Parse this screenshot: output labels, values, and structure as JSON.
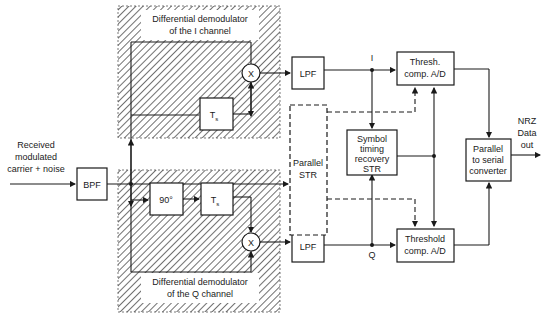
{
  "diagram": {
    "input_label_line1": "Received",
    "input_label_line2": "modulated",
    "input_label_line3": "carrier + noise",
    "bpf": "BPF",
    "i_channel": {
      "title_line1": "Differential demodulator",
      "title_line2": "of the I channel",
      "delay": "T",
      "delay_sub": "s",
      "multiplier": "X",
      "lpf": "LPF",
      "signal_label": "I"
    },
    "q_channel": {
      "title_line1": "Differential demodulator",
      "title_line2": "of the Q channel",
      "phase_shift": "90°",
      "delay": "T",
      "delay_sub": "s",
      "multiplier": "X",
      "lpf": "LPF",
      "signal_label": "Q"
    },
    "parallel_str_line1": "Parallel",
    "parallel_str_line2": "STR",
    "symbol_timing_line1": "Symbol",
    "symbol_timing_line2": "timing",
    "symbol_timing_line3": "recovery",
    "symbol_timing_line4": "STR",
    "thresh_i_line1": "Thresh.",
    "thresh_i_line2": "comp. A/D",
    "thresh_q_line1": "Threshold",
    "thresh_q_line2": "comp. A/D",
    "p2s_line1": "Parallel",
    "p2s_line2": "to serial",
    "p2s_line3": "converter",
    "output_line1": "NRZ",
    "output_line2": "Data",
    "output_line3": "out"
  }
}
